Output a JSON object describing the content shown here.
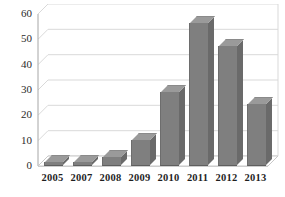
{
  "chart_data": {
    "type": "bar",
    "title": "",
    "xlabel": "",
    "ylabel": "",
    "categories": [
      "2005",
      "2007",
      "2008",
      "2009",
      "2010",
      "2011",
      "2012",
      "2013"
    ],
    "values": [
      1,
      1,
      3,
      10,
      29,
      56,
      47,
      24
    ],
    "ylim": [
      0,
      60
    ],
    "ytick_step": 10,
    "yticks": [
      "0",
      "10",
      "20",
      "30",
      "40",
      "50",
      "60"
    ],
    "grid": true,
    "grid_axis": "y",
    "legend": "none",
    "style": "3d-column",
    "bar_color": "#7f7f7f",
    "bar_top_color": "#9a9a9a",
    "bar_side_color": "#6a6a6a",
    "grid_color": "#d9d9d9",
    "axis_color": "#bfbfbf",
    "background": "#ffffff",
    "text_color": "#1f1f1f"
  }
}
